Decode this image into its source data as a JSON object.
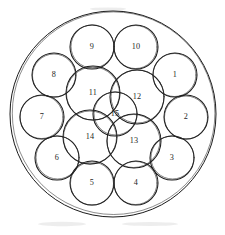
{
  "figure": {
    "background_color": "#ffffff",
    "stroke_color": "#1a1a1a",
    "label_color": "#1f1f1f"
  },
  "boundary": {
    "name": "outer-container-circle",
    "cx": 113,
    "cy": 114,
    "r": 103
  },
  "chart_data": {
    "type": "diagram",
    "subtitle": "",
    "xlabel": "",
    "ylabel": "",
    "grid": false,
    "legend": "none",
    "container": {
      "cx": 113,
      "cy": 114,
      "r": 103
    },
    "count": 15,
    "circles": [
      {
        "label": "1",
        "cx": 175,
        "cy": 75,
        "r": 22
      },
      {
        "label": "2",
        "cx": 186,
        "cy": 117,
        "r": 22
      },
      {
        "label": "3",
        "cx": 172,
        "cy": 158,
        "r": 22
      },
      {
        "label": "4",
        "cx": 136,
        "cy": 183,
        "r": 22
      },
      {
        "label": "5",
        "cx": 92,
        "cy": 183,
        "r": 22
      },
      {
        "label": "6",
        "cx": 57,
        "cy": 158,
        "r": 22
      },
      {
        "label": "7",
        "cx": 42,
        "cy": 117,
        "r": 22
      },
      {
        "label": "8",
        "cx": 54,
        "cy": 75,
        "r": 22
      },
      {
        "label": "9",
        "cx": 92,
        "cy": 47,
        "r": 22
      },
      {
        "label": "10",
        "cx": 136,
        "cy": 47,
        "r": 22
      },
      {
        "label": "11",
        "cx": 93,
        "cy": 93,
        "r": 27
      },
      {
        "label": "12",
        "cx": 137,
        "cy": 97,
        "r": 27
      },
      {
        "label": "13",
        "cx": 134,
        "cy": 141,
        "r": 27
      },
      {
        "label": "14",
        "cx": 90,
        "cy": 137,
        "r": 27
      },
      {
        "label": "15",
        "cx": 115,
        "cy": 114,
        "r": 22
      }
    ]
  }
}
